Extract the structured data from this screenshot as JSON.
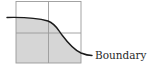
{
  "diagram": {
    "boundary_label": "Boundary",
    "grid": {
      "rows": 2,
      "cols": 2
    },
    "colors": {
      "shaded_region": "#d6d6d6",
      "grid_line": "#9a9a9a",
      "curve": "#1a1a1a",
      "background": "#ffffff"
    }
  }
}
